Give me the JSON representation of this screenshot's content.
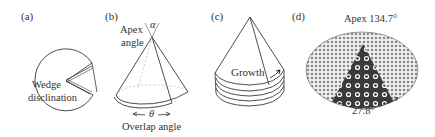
{
  "figure": {
    "panels": [
      {
        "id": "a",
        "label": "(a)",
        "annotation": {
          "line1": "Wedge",
          "line2": "disclination"
        }
      },
      {
        "id": "b",
        "label": "(b)",
        "apex_label": {
          "line1": "Apex",
          "line2": "angle"
        },
        "apex_symbol": "α",
        "overlap_symbol": "θ",
        "overlap_label": "Overlap angle"
      },
      {
        "id": "c",
        "label": "(c)",
        "growth_label": "Growth"
      },
      {
        "id": "d",
        "label": "(d)",
        "apex_text": "Apex 134.7°",
        "angle_text": "27.8°"
      }
    ],
    "colors": {
      "line": "#3a3a3a",
      "text": "#333333",
      "dark_sector": "#2b2b2b",
      "light_lattice": "#9a9a9a"
    }
  }
}
